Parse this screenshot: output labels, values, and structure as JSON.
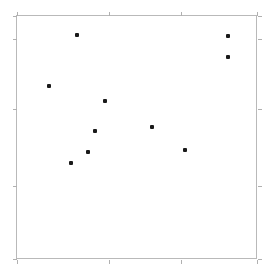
{
  "chart_data": {
    "type": "scatter",
    "title": "",
    "subtitle": "",
    "xlabel": "",
    "ylabel": "",
    "xlim": [
      0,
      1
    ],
    "ylim": [
      0,
      1
    ],
    "grid": false,
    "legend": null,
    "annotations": [],
    "xtick_labels": [],
    "ytick_labels": [],
    "xticks_px": [
      16,
      108,
      180,
      257
    ],
    "yticks_px": [
      15,
      38,
      108,
      185,
      259
    ],
    "marker": {
      "shape": "square",
      "color": "#1a1a1a",
      "size_px": 4
    },
    "frame": {
      "color": "#b9b9b9",
      "left_px": 16,
      "top_px": 15,
      "right_px": 257,
      "bottom_px": 259
    },
    "points_px": [
      {
        "x": 76,
        "y": 34
      },
      {
        "x": 227,
        "y": 35
      },
      {
        "x": 227,
        "y": 56
      },
      {
        "x": 48,
        "y": 85
      },
      {
        "x": 104,
        "y": 100
      },
      {
        "x": 94,
        "y": 130
      },
      {
        "x": 151,
        "y": 126
      },
      {
        "x": 184,
        "y": 149
      },
      {
        "x": 87,
        "y": 151
      },
      {
        "x": 70,
        "y": 162
      }
    ],
    "x": [
      0.249,
      0.876,
      0.876,
      0.133,
      0.365,
      0.324,
      0.561,
      0.697,
      0.295,
      0.224
    ],
    "y": [
      0.922,
      0.918,
      0.832,
      0.713,
      0.652,
      0.529,
      0.545,
      0.451,
      0.443,
      0.398
    ],
    "n_points": 10
  }
}
